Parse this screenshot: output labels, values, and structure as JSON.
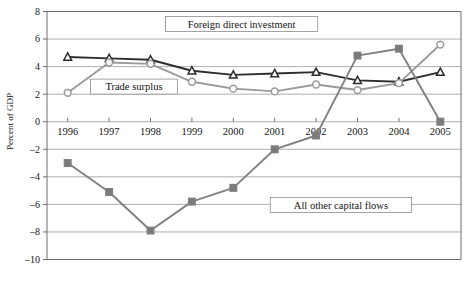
{
  "chart_data": {
    "type": "line",
    "title": "",
    "xlabel": "",
    "ylabel": "Percent of GDP",
    "categories": [
      "1996",
      "1997",
      "1998",
      "1999",
      "2000",
      "2001",
      "2002",
      "2003",
      "2004",
      "2005"
    ],
    "ylim": [
      -10,
      8
    ],
    "ytick_step": 2,
    "yticks": [
      "8",
      "6",
      "4",
      "2",
      "0",
      "–2",
      "–4",
      "–6",
      "–8",
      "–10"
    ],
    "ytick_values": [
      8,
      6,
      4,
      2,
      0,
      -2,
      -4,
      -6,
      -8,
      -10
    ],
    "grid": true,
    "legend_position": "inline-annotations",
    "series": [
      {
        "name": "Foreign direct investment",
        "marker": "triangle",
        "color": "#2d2d2d",
        "marker_fill": "#ffffff",
        "values": [
          4.7,
          4.6,
          4.5,
          3.7,
          3.4,
          3.5,
          3.6,
          3.0,
          2.9,
          3.6
        ]
      },
      {
        "name": "Trade surplus",
        "marker": "circle",
        "color": "#9a9a9a",
        "marker_fill": "#ffffff",
        "values": [
          2.1,
          4.3,
          4.2,
          2.9,
          2.4,
          2.2,
          2.7,
          2.3,
          2.8,
          5.6
        ]
      },
      {
        "name": "All other capital flows",
        "marker": "square",
        "color": "#808080",
        "marker_fill": "#7a7a7a",
        "values": [
          -3.0,
          -5.1,
          -7.9,
          -5.8,
          -4.8,
          -2.0,
          -1.0,
          4.8,
          5.3,
          0.0
        ]
      }
    ],
    "annotations": [
      {
        "text": "Foreign direct investment",
        "x_value": 2000.2,
        "y_value": 7.1
      },
      {
        "text": "Trade surplus",
        "x_value": 1997.6,
        "y_value": 2.55
      },
      {
        "text": "All other capital flows",
        "x_value": 2002.6,
        "y_value": -6.05
      }
    ]
  }
}
